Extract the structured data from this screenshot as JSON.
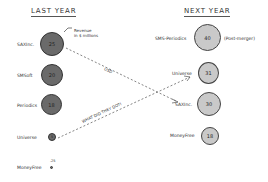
{
  "last_year": {
    "title": "LAST YEAR",
    "items": [
      {
        "name": "SAXInc.",
        "value": "25"
      },
      {
        "name": "SMSoft",
        "value": "20"
      },
      {
        "name": "Periodics",
        "value": "18"
      },
      {
        "name": "Universe",
        "value": "5"
      },
      {
        "name": "MoneyFree",
        "value": ".25"
      }
    ]
  },
  "next_year": {
    "title": "NEXT YEAR",
    "items": [
      {
        "name": "SMS-Periodics",
        "value": "40",
        "note": "(Post-merger)"
      },
      {
        "name": "Universe",
        "value": "31"
      },
      {
        "name": "SAXInc.",
        "value": "30"
      },
      {
        "name": "MoneyFree",
        "value": "18"
      }
    ]
  },
  "annotations": {
    "revenue_note_line1": "Revenue",
    "revenue_note_line2": "in $ millions",
    "arrow1_label": "USD",
    "arrow2_label": "WHAT DID THEY DO?!"
  },
  "colors": {
    "last_year_fill": "#6a6a6a",
    "next_year_fill": "#c9c9c9"
  }
}
